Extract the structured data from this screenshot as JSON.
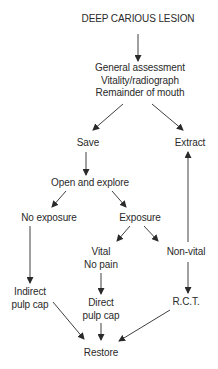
{
  "diagram": {
    "type": "flowchart",
    "nodes": {
      "lesion": {
        "lines": [
          "DEEP CARIOUS LESION"
        ]
      },
      "assessment": {
        "lines": [
          "General assessment",
          "Vitality/radiograph",
          "Remainder of mouth"
        ]
      },
      "save": {
        "lines": [
          "Save"
        ]
      },
      "extract": {
        "lines": [
          "Extract"
        ]
      },
      "open_explore": {
        "lines": [
          "Open and explore"
        ]
      },
      "no_exposure": {
        "lines": [
          "No exposure"
        ]
      },
      "exposure": {
        "lines": [
          "Exposure"
        ]
      },
      "vital": {
        "lines": [
          "Vital",
          "No pain"
        ]
      },
      "non_vital": {
        "lines": [
          "Non-vital"
        ]
      },
      "indirect_pulp_cap": {
        "lines": [
          "Indirect",
          "pulp cap"
        ]
      },
      "direct_pulp_cap": {
        "lines": [
          "Direct",
          "pulp cap"
        ]
      },
      "rct": {
        "lines": [
          "R.C.T."
        ]
      },
      "restore": {
        "lines": [
          "Restore"
        ]
      }
    },
    "edges": [
      {
        "from": "DEEP CARIOUS LESION",
        "to": "General assessment"
      },
      {
        "from": "General assessment",
        "to": "Save"
      },
      {
        "from": "General assessment",
        "to": "Extract"
      },
      {
        "from": "Save",
        "to": "Open and explore"
      },
      {
        "from": "Open and explore",
        "to": "No exposure"
      },
      {
        "from": "Open and explore",
        "to": "Exposure"
      },
      {
        "from": "Exposure",
        "to": "Vital / No pain"
      },
      {
        "from": "Exposure",
        "to": "Non-vital"
      },
      {
        "from": "Non-vital",
        "to": "Extract"
      },
      {
        "from": "Non-vital",
        "to": "R.C.T."
      },
      {
        "from": "No exposure",
        "to": "Indirect pulp cap"
      },
      {
        "from": "Vital / No pain",
        "to": "Direct pulp cap"
      },
      {
        "from": "Indirect pulp cap",
        "to": "Restore"
      },
      {
        "from": "Direct pulp cap",
        "to": "Restore"
      },
      {
        "from": "R.C.T.",
        "to": "Restore"
      }
    ],
    "colors": {
      "text": "#2a2a2a",
      "arrow": "#2a2a2a",
      "background": "#ffffff"
    }
  }
}
